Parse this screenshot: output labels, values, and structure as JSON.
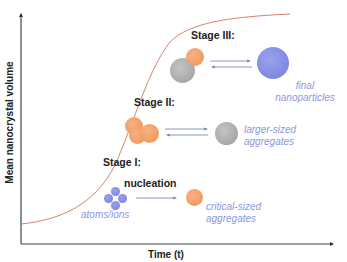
{
  "diagram": {
    "type": "nanocrystal growth stages",
    "axes": {
      "x_label": "Time (t)",
      "y_label": "Mean nanocrystal volume"
    },
    "curve": {
      "shape": "sigmoid",
      "color": "#d9826e"
    },
    "stages": [
      {
        "label": "Stage I:",
        "process_label": "nucleation",
        "from_label": "atoms/ions",
        "to_label_line1": "critical-sized",
        "to_label_line2": "aggregates",
        "arrow": "forward"
      },
      {
        "label": "Stage II:",
        "to_label_line1": "larger-sized",
        "to_label_line2": "aggregates",
        "arrow": "equilibrium"
      },
      {
        "label": "Stage III:",
        "to_label_line1": "final",
        "to_label_line2": "nanoparticles",
        "arrow": "equilibrium"
      }
    ],
    "colors": {
      "orange": "#f39b60",
      "gray": "#a8a8a8",
      "blue": "#7f88e2",
      "label_blue": "#8e96dc",
      "arrow_blue": "#7f88c8",
      "axis": "#333333"
    }
  }
}
